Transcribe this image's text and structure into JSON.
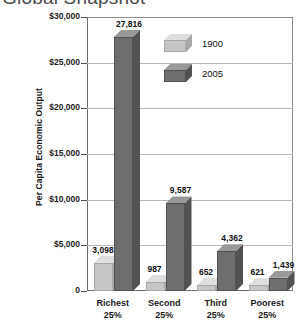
{
  "chart_data": {
    "type": "bar",
    "title": "Global Snapshot",
    "xlabel": "",
    "ylabel": "Per Capita Economic Output",
    "categories": [
      "Richest 25%",
      "Second 25%",
      "Third 25%",
      "Poorest 25%"
    ],
    "category_lines": [
      [
        "Richest",
        "25%"
      ],
      [
        "Second",
        "25%"
      ],
      [
        "Third",
        "25%"
      ],
      [
        "Poorest",
        "25%"
      ]
    ],
    "series": [
      {
        "name": "1900",
        "color": "#c6c6c6",
        "values": [
          3098,
          987,
          652,
          621
        ],
        "value_labels": [
          "3,098",
          "987",
          "652",
          "621"
        ]
      },
      {
        "name": "2005",
        "color": "#6e6e6e",
        "values": [
          27816,
          9587,
          4362,
          1439
        ],
        "value_labels": [
          "27,816",
          "9,587",
          "4,362",
          "1,439"
        ]
      }
    ],
    "ylim": [
      0,
      30000
    ],
    "yticks": [
      0,
      5000,
      10000,
      15000,
      20000,
      25000,
      30000
    ],
    "ytick_labels": [
      "0",
      "$5,000",
      "$10,000",
      "$15,000",
      "$20,000",
      "$25,000",
      "$30,000"
    ],
    "grid": true,
    "legend_position": "top-center",
    "style": "3d-column"
  },
  "legend": {
    "items": [
      {
        "label": "1900",
        "color": "#c6c6c6"
      },
      {
        "label": "2005",
        "color": "#6e6e6e"
      }
    ]
  },
  "colors": {
    "series_1900_front": "#c6c6c6",
    "series_1900_top": "#dedede",
    "series_1900_side": "#a8a8a8",
    "series_2005_front": "#6e6e6e",
    "series_2005_top": "#989898",
    "series_2005_side": "#525252",
    "gridline": "#b9b9b9",
    "frame": "#8d8d8d",
    "title_text": "#4a4a4a"
  }
}
